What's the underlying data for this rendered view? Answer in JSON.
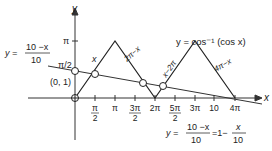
{
  "figure": {
    "axes": {
      "x_label": "x",
      "y_label": "y",
      "origin_px": [
        75,
        98
      ],
      "unit_pi_px": 40
    },
    "y_ticks": [
      {
        "label": "π",
        "value": "pi"
      },
      {
        "label": "π/2",
        "value": "pi/2"
      }
    ],
    "x_ticks": [
      {
        "num": "π",
        "den": "2"
      },
      {
        "num": "π",
        "den": ""
      },
      {
        "num": "3π",
        "den": "2"
      },
      {
        "num": "2π",
        "den": ""
      },
      {
        "num": "5π",
        "den": "2"
      },
      {
        "num": "3π",
        "den": ""
      },
      {
        "num": "10",
        "den": ""
      },
      {
        "num": "4π",
        "den": ""
      }
    ],
    "curve_title": "y = cos⁻¹ (cos x)",
    "segment_labels": [
      "x",
      "2π−x",
      "x−2π",
      "4π−x"
    ],
    "line_left_label": {
      "lhs": "y =",
      "num": "10 −x",
      "den": "10"
    },
    "line_bottom_label": {
      "lhs": "y =",
      "num": "10 −x",
      "den": "10",
      "mid": "=1−",
      "num2": "x",
      "den2": "10"
    },
    "point_label": "(0, 1)",
    "colors": {
      "ink": "#222222",
      "background": "#ffffff"
    }
  }
}
